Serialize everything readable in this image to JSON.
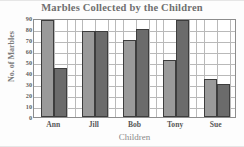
{
  "chart_data": {
    "type": "bar",
    "title": "Marbles Collected by the Children",
    "xlabel": "Children",
    "ylabel": "No. of Marbles",
    "categories": [
      "Ann",
      "Jill",
      "Bob",
      "Tony",
      "Sue"
    ],
    "series": [
      {
        "name": "first-bar",
        "color": "#9a9a9a",
        "values": [
          88,
          78,
          70,
          52,
          35
        ]
      },
      {
        "name": "second-bar",
        "color": "#6b6b6b",
        "values": [
          45,
          78,
          80,
          88,
          30
        ]
      }
    ],
    "ylim": [
      0,
      90
    ],
    "ytick_labels": [
      "90",
      "80",
      "70",
      "60",
      "50",
      "40",
      "30",
      "20",
      "10",
      "0"
    ],
    "ytick_values": [
      90,
      80,
      70,
      60,
      50,
      40,
      30,
      20,
      10,
      0
    ],
    "ytick_step": 10,
    "grid": true,
    "legend": "none",
    "bar_border_color": "#3d3d3d",
    "frame_color": "#8d8d8d",
    "gridline_color": "#b9b9b9",
    "title_color": "#6f6f6f",
    "axis_label_color": "#8a8a8a"
  }
}
